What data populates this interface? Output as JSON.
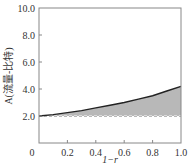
{
  "chart_data": {
    "type": "area",
    "title": "",
    "xlabel": "1−r",
    "ylabel": "A(流量-比特)",
    "xlim": [
      0,
      1.0
    ],
    "ylim": [
      0,
      10.0
    ],
    "x_ticks": [
      "0",
      "0.2",
      "0.4",
      "0.6",
      "0.8",
      "1.0"
    ],
    "y_ticks": [
      "2.0",
      "4.0",
      "6.0",
      "8.0",
      "10.0"
    ],
    "grid": false,
    "legend": null,
    "series": [
      {
        "name": "A",
        "style": "solid line with shaded area down to baseline",
        "x": [
          0.0,
          0.1,
          0.2,
          0.3,
          0.4,
          0.5,
          0.6,
          0.7,
          0.8,
          0.9,
          1.0
        ],
        "values": [
          2.0,
          2.1,
          2.25,
          2.4,
          2.6,
          2.8,
          3.0,
          3.25,
          3.5,
          3.85,
          4.2
        ]
      },
      {
        "name": "baseline",
        "style": "dashed line",
        "x": [
          0.0,
          1.0
        ],
        "values": [
          2.0,
          2.0
        ]
      }
    ],
    "colors": {
      "fill": "#b8b8b8",
      "line": "#222222",
      "axis": "#888888"
    }
  }
}
